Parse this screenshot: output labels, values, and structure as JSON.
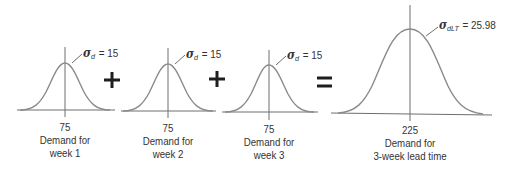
{
  "diagram": {
    "operators": {
      "plus_1": "+",
      "plus_2": "+",
      "equals": "="
    },
    "distributions": [
      {
        "id": "week-1",
        "mean": "75",
        "caption_line1": "Demand for",
        "caption_line2": "week 1",
        "sigma_symbol": "σ",
        "sigma_subscript": "d",
        "sigma_value": "= 15"
      },
      {
        "id": "week-2",
        "mean": "75",
        "caption_line1": "Demand for",
        "caption_line2": "week 2",
        "sigma_symbol": "σ",
        "sigma_subscript": "d",
        "sigma_value": "= 15"
      },
      {
        "id": "week-3",
        "mean": "75",
        "caption_line1": "Demand for",
        "caption_line2": "week 3",
        "sigma_symbol": "σ",
        "sigma_subscript": "d",
        "sigma_value": "= 15"
      },
      {
        "id": "lead-time",
        "mean": "225",
        "caption_line1": "Demand for",
        "caption_line2": "3-week lead time",
        "sigma_symbol": "σ",
        "sigma_subscript": "dLT",
        "sigma_value": "= 25.98"
      }
    ],
    "colors": {
      "curve": "#8a8a8a",
      "axis": "#6e6e6e",
      "operator": "#1e1e1e",
      "text": "#333333"
    }
  }
}
